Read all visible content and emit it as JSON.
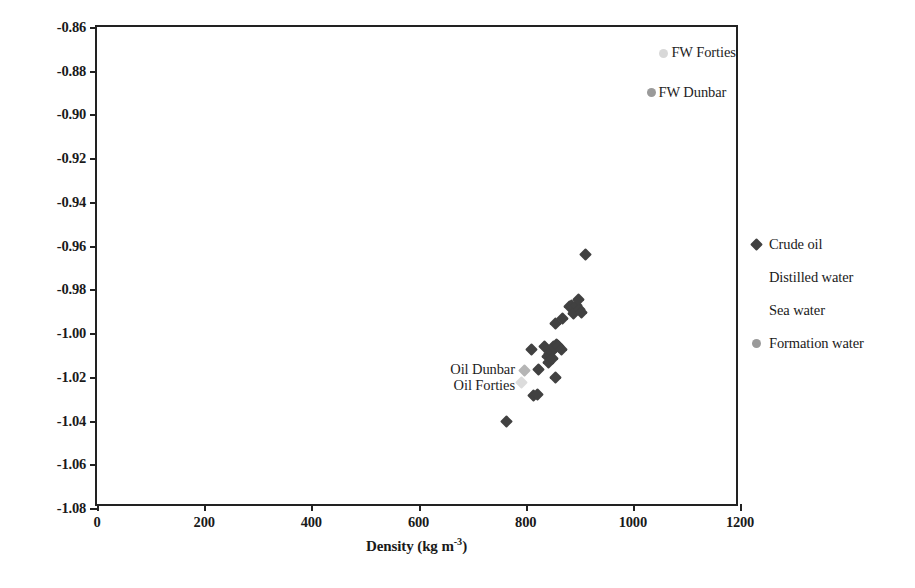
{
  "chart_data": {
    "type": "scatter",
    "title": "",
    "xlabel": "Density (kg m-3)",
    "xlabel_base": "Density (kg m",
    "xlabel_sup": "-3",
    "xlabel_tail": ")",
    "ylabel": "Mass magnetic susceptibility (10-8 m3kg-1)",
    "ylabel_parts": {
      "p1": "Mass magnetic susceptibility (10",
      "s1": "-8",
      "p2": " m",
      "s2": "3",
      "p3": "kg",
      "s3": "-1",
      "p4": ")"
    },
    "xlim": [
      0,
      1200
    ],
    "ylim": [
      -1.08,
      -0.86
    ],
    "xticks": [
      0,
      200,
      400,
      600,
      800,
      1000,
      1200
    ],
    "xtick_labels": [
      "0",
      "200",
      "400",
      "600",
      "800",
      "1000",
      "1200"
    ],
    "yticks": [
      -0.86,
      -0.88,
      -0.9,
      -0.92,
      -0.94,
      -0.96,
      -0.98,
      -1.0,
      -1.02,
      -1.04,
      -1.06,
      -1.08
    ],
    "ytick_labels": [
      "-0.86",
      "-0.88",
      "-0.90",
      "-0.92",
      "-0.94",
      "-0.96",
      "-0.98",
      "-1.00",
      "-1.02",
      "-1.04",
      "-1.06",
      "-1.08"
    ],
    "grid": false,
    "legend_position": "right",
    "colors": {
      "crude_oil": "#414141",
      "distilled_water": "#ffffff",
      "sea_water": "#ffffff",
      "formation_water": "#9a9a9a",
      "fw_forties": "#d8d8d8",
      "fw_dunbar": "#9a9a9a",
      "oil_dunbar": "#b5b5b5",
      "oil_forties": "#dcdcdc",
      "axis": "#222222"
    },
    "series": [
      {
        "name": "Crude oil",
        "marker": "diamond",
        "color": "#414141",
        "points": [
          [
            764,
            -1.0405
          ],
          [
            815,
            -1.0285
          ],
          [
            822,
            -1.028
          ],
          [
            811,
            -1.0075
          ],
          [
            824,
            -1.0165
          ],
          [
            836,
            -1.006
          ],
          [
            841,
            -1.0105
          ],
          [
            843,
            -1.0135
          ],
          [
            845,
            -1.0095
          ],
          [
            848,
            -1.0085
          ],
          [
            850,
            -1.0115
          ],
          [
            852,
            -1.006
          ],
          [
            855,
            -1.0205
          ],
          [
            858,
            -1.005
          ],
          [
            860,
            -1.0055
          ],
          [
            862,
            -1.006
          ],
          [
            866,
            -1.0075
          ],
          [
            856,
            -0.9955
          ],
          [
            869,
            -0.9935
          ],
          [
            882,
            -0.988
          ],
          [
            886,
            -0.9875
          ],
          [
            890,
            -0.991
          ],
          [
            895,
            -0.9875
          ],
          [
            900,
            -0.989
          ],
          [
            905,
            -0.9905
          ],
          [
            898,
            -0.9845
          ],
          [
            911,
            -0.964
          ]
        ]
      },
      {
        "name": "Distilled water",
        "marker": "diamond",
        "color": "#ffffff",
        "points": []
      },
      {
        "name": "Sea water",
        "marker": "circle",
        "color": "#ffffff",
        "points": []
      },
      {
        "name": "Formation water",
        "marker": "circle",
        "color": "#9a9a9a",
        "points": [
          [
            1058,
            -0.872
          ],
          [
            1034,
            -0.89
          ]
        ]
      }
    ],
    "annotations": [
      {
        "id": "fw-forties",
        "text": "FW Forties",
        "x": 1072,
        "y": -0.872,
        "align": "left"
      },
      {
        "id": "fw-dunbar",
        "text": "FW Dunbar",
        "x": 1048,
        "y": -0.89,
        "align": "left"
      },
      {
        "id": "oil-dunbar",
        "text": "Oil Dunbar",
        "x": 780,
        "y": -1.017,
        "align": "right"
      },
      {
        "id": "oil-forties",
        "text": "Oil Forties",
        "x": 780,
        "y": -1.024,
        "align": "right"
      }
    ],
    "marked_samples": [
      {
        "name": "Oil Dunbar",
        "x": 797,
        "y": -1.017,
        "marker": "diamond",
        "color": "#b5b5b5"
      },
      {
        "name": "Oil Forties",
        "x": 792,
        "y": -1.0225,
        "marker": "diamond",
        "color": "#dcdcdc"
      }
    ]
  },
  "legend": {
    "items": [
      {
        "label": "Crude oil",
        "marker": "diamond",
        "color": "#414141",
        "visible_marker": true
      },
      {
        "label": "Distilled water",
        "marker": "diamond",
        "color": "#ffffff",
        "visible_marker": false
      },
      {
        "label": "Sea water",
        "marker": "circle",
        "color": "#ffffff",
        "visible_marker": false
      },
      {
        "label": "Formation water",
        "marker": "circle",
        "color": "#9a9a9a",
        "visible_marker": true
      }
    ]
  }
}
